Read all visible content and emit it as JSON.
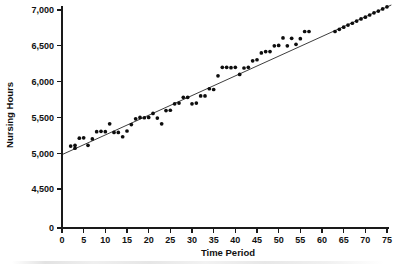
{
  "chart_data": {
    "type": "scatter",
    "title": "",
    "xlabel": "Time Period",
    "ylabel": "Nursing Hours",
    "xlim": [
      0,
      75
    ],
    "ylim": [
      4300,
      7100
    ],
    "grid": false,
    "legend": "none",
    "y_axis_break": true,
    "y_axis_break_note": "Axis shows 0 at origin then jumps to the 4,500-7,000 range",
    "xticks": [
      0,
      5,
      10,
      15,
      20,
      25,
      30,
      35,
      40,
      45,
      50,
      55,
      60,
      65,
      70,
      75
    ],
    "xticklabels": [
      "0",
      "5",
      "10",
      "15",
      "20",
      "25",
      "30",
      "35",
      "40",
      "45",
      "50",
      "55",
      "60",
      "65",
      "70",
      "75"
    ],
    "yticks": [
      0,
      4500,
      5000,
      5500,
      6000,
      6500,
      7000
    ],
    "yticklabels": [
      "0",
      "4,500",
      "5,000",
      "5,500",
      "6,000",
      "6,500",
      "7,000"
    ],
    "series": [
      {
        "name": "Nursing hours observations",
        "marker": "filled-circle",
        "color": "#0d0d0d",
        "points": [
          [
            2,
            5100
          ],
          [
            3,
            5110
          ],
          [
            3,
            5070
          ],
          [
            4,
            5210
          ],
          [
            5,
            5215
          ],
          [
            6,
            5110
          ],
          [
            7,
            5200
          ],
          [
            8,
            5300
          ],
          [
            9,
            5305
          ],
          [
            10,
            5300
          ],
          [
            11,
            5410
          ],
          [
            12,
            5290
          ],
          [
            13,
            5290
          ],
          [
            14,
            5230
          ],
          [
            15,
            5310
          ],
          [
            16,
            5400
          ],
          [
            17,
            5480
          ],
          [
            18,
            5500
          ],
          [
            19,
            5495
          ],
          [
            20,
            5500
          ],
          [
            21,
            5555
          ],
          [
            22,
            5490
          ],
          [
            23,
            5410
          ],
          [
            24,
            5595
          ],
          [
            25,
            5600
          ],
          [
            26,
            5690
          ],
          [
            27,
            5700
          ],
          [
            28,
            5780
          ],
          [
            29,
            5780
          ],
          [
            30,
            5690
          ],
          [
            31,
            5700
          ],
          [
            32,
            5800
          ],
          [
            33,
            5800
          ],
          [
            34,
            5900
          ],
          [
            35,
            5890
          ],
          [
            36,
            6080
          ],
          [
            37,
            6200
          ],
          [
            38,
            6200
          ],
          [
            39,
            6195
          ],
          [
            40,
            6200
          ],
          [
            41,
            6100
          ],
          [
            42,
            6190
          ],
          [
            43,
            6200
          ],
          [
            44,
            6290
          ],
          [
            45,
            6305
          ],
          [
            46,
            6400
          ],
          [
            47,
            6420
          ],
          [
            48,
            6420
          ],
          [
            49,
            6500
          ],
          [
            50,
            6505
          ],
          [
            51,
            6610
          ],
          [
            52,
            6500
          ],
          [
            53,
            6605
          ],
          [
            54,
            6520
          ],
          [
            55,
            6600
          ],
          [
            56,
            6700
          ],
          [
            57,
            6700
          ]
        ]
      },
      {
        "name": "Forecast points on trend line",
        "marker": "filled-circle",
        "color": "#0d0d0d",
        "points": [
          [
            63,
            6700
          ],
          [
            64,
            6730
          ],
          [
            65,
            6760
          ],
          [
            66,
            6790
          ],
          [
            67,
            6815
          ],
          [
            68,
            6845
          ],
          [
            69,
            6875
          ],
          [
            70,
            6900
          ],
          [
            71,
            6930
          ],
          [
            72,
            6960
          ],
          [
            73,
            6985
          ],
          [
            74,
            7015
          ],
          [
            75,
            7045
          ]
        ]
      }
    ],
    "trend_line": {
      "name": "Least squares regression line",
      "style": "solid-thin",
      "color": "#1a1a1a",
      "intercept": 4980,
      "slope": 27.5,
      "x_start": 0,
      "x_end": 76,
      "y_start": 4980,
      "y_end": 7070
    }
  }
}
